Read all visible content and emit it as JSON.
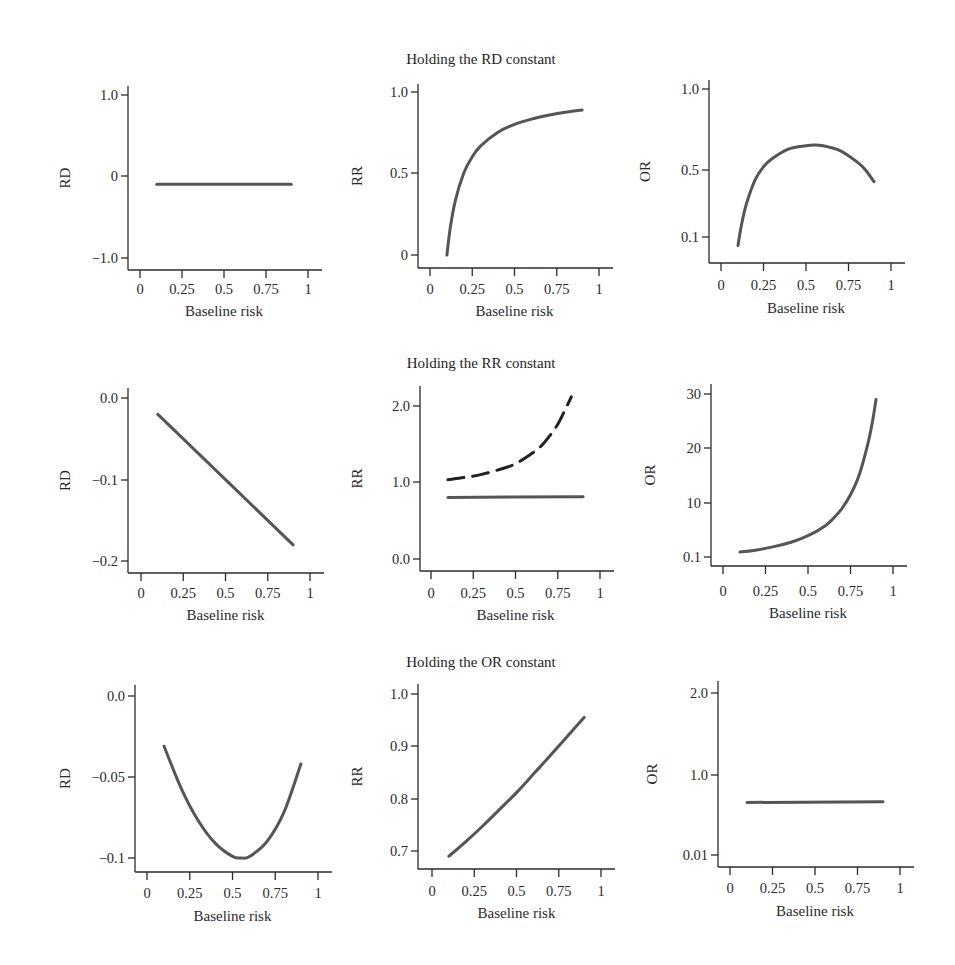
{
  "figure": {
    "row_titles": [
      "Holding the RD constant",
      "Holding the RR constant",
      "Holding the OR constant"
    ]
  },
  "chart_data": [
    {
      "type": "line",
      "row": 0,
      "col": 0,
      "title": "Holding the RD constant",
      "xlabel": "Baseline risk",
      "ylabel": "RD",
      "xticks": [
        0,
        0.25,
        0.5,
        0.75,
        1
      ],
      "xtick_labels": [
        "0",
        "0.25",
        "0.5",
        "0.75",
        "1"
      ],
      "yticks": [
        -1.0,
        0,
        1.0
      ],
      "ytick_labels": [
        "−1.0",
        "0",
        "1.0"
      ],
      "xlim": [
        0,
        1
      ],
      "ylim": [
        -1.0,
        1.0
      ],
      "grid": false,
      "series": [
        {
          "name": "RD",
          "style": "solid",
          "x": [
            0.1,
            0.3,
            0.5,
            0.7,
            0.9
          ],
          "y": [
            -0.1,
            -0.1,
            -0.1,
            -0.1,
            -0.1
          ]
        }
      ]
    },
    {
      "type": "line",
      "row": 0,
      "col": 1,
      "title": "Holding the RD constant",
      "xlabel": "Baseline risk",
      "ylabel": "RR",
      "xticks": [
        0,
        0.25,
        0.5,
        0.75,
        1
      ],
      "xtick_labels": [
        "0",
        "0.25",
        "0.5",
        "0.75",
        "1"
      ],
      "yticks": [
        0,
        0.5,
        1.0
      ],
      "ytick_labels": [
        "0",
        "0.5",
        "1.0"
      ],
      "xlim": [
        0,
        1
      ],
      "ylim": [
        0,
        1.0
      ],
      "grid": false,
      "series": [
        {
          "name": "RR",
          "style": "solid",
          "x": [
            0.1,
            0.12,
            0.15,
            0.2,
            0.25,
            0.3,
            0.4,
            0.5,
            0.6,
            0.7,
            0.8,
            0.9
          ],
          "y": [
            0.0,
            0.167,
            0.333,
            0.5,
            0.6,
            0.667,
            0.75,
            0.8,
            0.833,
            0.857,
            0.875,
            0.889
          ]
        }
      ]
    },
    {
      "type": "line",
      "row": 0,
      "col": 2,
      "title": "Holding the RD constant",
      "xlabel": "Baseline risk",
      "ylabel": "OR",
      "xticks": [
        0,
        0.25,
        0.5,
        0.75,
        1
      ],
      "xtick_labels": [
        "0",
        "0.25",
        "0.5",
        "0.75",
        "1"
      ],
      "yticks": [
        0.1,
        0.5,
        1.0
      ],
      "ytick_labels": [
        "0.1",
        "0.5",
        "1.0"
      ],
      "xlim": [
        0,
        1
      ],
      "ylim": [
        0,
        1.0
      ],
      "grid": false,
      "series": [
        {
          "name": "OR",
          "style": "solid",
          "x": [
            0.1,
            0.12,
            0.15,
            0.2,
            0.25,
            0.3,
            0.4,
            0.5,
            0.55,
            0.6,
            0.7,
            0.8,
            0.85,
            0.9
          ],
          "y": [
            0.05,
            0.17,
            0.3,
            0.44,
            0.52,
            0.57,
            0.63,
            0.65,
            0.655,
            0.65,
            0.62,
            0.55,
            0.5,
            0.43
          ]
        }
      ]
    },
    {
      "type": "line",
      "row": 1,
      "col": 0,
      "title": "Holding the RR constant",
      "xlabel": "Baseline risk",
      "ylabel": "RD",
      "xticks": [
        0,
        0.25,
        0.5,
        0.75,
        1
      ],
      "xtick_labels": [
        "0",
        "0.25",
        "0.5",
        "0.75",
        "1"
      ],
      "yticks": [
        -0.2,
        -0.1,
        0.0
      ],
      "ytick_labels": [
        "−0.2",
        "−0.1",
        "0.0"
      ],
      "xlim": [
        0,
        1
      ],
      "ylim": [
        -0.2,
        0.0
      ],
      "grid": false,
      "series": [
        {
          "name": "RD",
          "style": "solid",
          "x": [
            0.1,
            0.9
          ],
          "y": [
            -0.02,
            -0.18
          ]
        }
      ]
    },
    {
      "type": "line",
      "row": 1,
      "col": 1,
      "title": "Holding the RR constant",
      "xlabel": "Baseline risk",
      "ylabel": "RR",
      "xticks": [
        0,
        0.25,
        0.5,
        0.75,
        1
      ],
      "xtick_labels": [
        "0",
        "0.25",
        "0.5",
        "0.75",
        "1"
      ],
      "yticks": [
        0.0,
        1.0,
        2.0
      ],
      "ytick_labels": [
        "0.0",
        "1.0",
        "2.0"
      ],
      "xlim": [
        0,
        1
      ],
      "ylim": [
        0.0,
        2.0
      ],
      "grid": false,
      "series": [
        {
          "name": "RR (protective, constant)",
          "style": "solid",
          "x": [
            0.1,
            0.9
          ],
          "y": [
            0.8,
            0.81
          ]
        },
        {
          "name": "RR (harmful, constant)",
          "style": "dashed",
          "x": [
            0.1,
            0.2,
            0.3,
            0.4,
            0.5,
            0.6,
            0.65,
            0.7,
            0.75,
            0.8,
            0.83
          ],
          "y": [
            1.03,
            1.06,
            1.1,
            1.16,
            1.24,
            1.38,
            1.47,
            1.6,
            1.76,
            1.98,
            2.12
          ]
        }
      ]
    },
    {
      "type": "line",
      "row": 1,
      "col": 2,
      "title": "Holding the RR constant",
      "xlabel": "Baseline risk",
      "ylabel": "OR",
      "xticks": [
        0,
        0.25,
        0.5,
        0.75,
        1
      ],
      "xtick_labels": [
        "0",
        "0.25",
        "0.5",
        "0.75",
        "1"
      ],
      "yticks": [
        0.1,
        10,
        20,
        30
      ],
      "ytick_labels": [
        "0.1",
        "10",
        "20",
        "30"
      ],
      "xlim": [
        0,
        1
      ],
      "ylim": [
        0.1,
        30
      ],
      "grid": false,
      "series": [
        {
          "name": "OR",
          "style": "solid",
          "x": [
            0.1,
            0.2,
            0.3,
            0.4,
            0.5,
            0.6,
            0.65,
            0.7,
            0.75,
            0.8,
            0.85,
            0.88,
            0.9
          ],
          "y": [
            1.0,
            1.4,
            2.0,
            2.8,
            4.0,
            5.8,
            7.2,
            9.0,
            11.5,
            15.0,
            20.5,
            25.0,
            29.0
          ]
        }
      ]
    },
    {
      "type": "line",
      "row": 2,
      "col": 0,
      "title": "Holding the OR constant",
      "xlabel": "Baseline risk",
      "ylabel": "RD",
      "xticks": [
        0,
        0.25,
        0.5,
        0.75,
        1
      ],
      "xtick_labels": [
        "0",
        "0.25",
        "0.5",
        "0.75",
        "1"
      ],
      "yticks": [
        -0.1,
        -0.05,
        0.0
      ],
      "ytick_labels": [
        "−0.1",
        "−0.05",
        "0.0"
      ],
      "xlim": [
        0,
        1
      ],
      "ylim": [
        -0.1,
        0.0
      ],
      "grid": false,
      "series": [
        {
          "name": "RD",
          "style": "solid",
          "x": [
            0.1,
            0.2,
            0.3,
            0.4,
            0.5,
            0.55,
            0.6,
            0.7,
            0.8,
            0.9
          ],
          "y": [
            -0.031,
            -0.057,
            -0.077,
            -0.091,
            -0.099,
            -0.1,
            -0.099,
            -0.09,
            -0.072,
            -0.042
          ]
        }
      ]
    },
    {
      "type": "line",
      "row": 2,
      "col": 1,
      "title": "Holding the OR constant",
      "xlabel": "Baseline risk",
      "ylabel": "RR",
      "xticks": [
        0,
        0.25,
        0.5,
        0.75,
        1
      ],
      "xtick_labels": [
        "0",
        "0.25",
        "0.5",
        "0.75",
        "1"
      ],
      "yticks": [
        0.7,
        0.8,
        0.9,
        1.0
      ],
      "ytick_labels": [
        "0.7",
        "0.8",
        "0.9",
        "1.0"
      ],
      "xlim": [
        0,
        1
      ],
      "ylim": [
        0.7,
        1.0
      ],
      "grid": false,
      "series": [
        {
          "name": "RR",
          "style": "solid",
          "x": [
            0.1,
            0.2,
            0.3,
            0.4,
            0.5,
            0.6,
            0.7,
            0.8,
            0.9
          ],
          "y": [
            0.69,
            0.718,
            0.748,
            0.78,
            0.812,
            0.847,
            0.882,
            0.918,
            0.955
          ]
        }
      ]
    },
    {
      "type": "line",
      "row": 2,
      "col": 2,
      "title": "Holding the OR constant",
      "xlabel": "Baseline risk",
      "ylabel": "OR",
      "xticks": [
        0,
        0.25,
        0.5,
        0.75,
        1
      ],
      "xtick_labels": [
        "0",
        "0.25",
        "0.5",
        "0.75",
        "1"
      ],
      "yticks": [
        0.01,
        1.0,
        2.0
      ],
      "ytick_labels": [
        "0.01",
        "1.0",
        "2.0"
      ],
      "xlim": [
        0,
        1
      ],
      "ylim": [
        0.01,
        2.0
      ],
      "grid": false,
      "series": [
        {
          "name": "OR",
          "style": "solid",
          "x": [
            0.1,
            0.9
          ],
          "y": [
            0.66,
            0.67
          ]
        }
      ]
    }
  ]
}
